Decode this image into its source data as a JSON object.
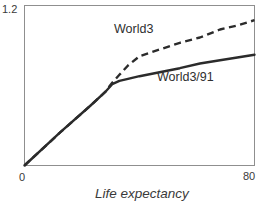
{
  "chart_data": {
    "type": "line",
    "title": "",
    "xlabel": "Life expectancy",
    "ylabel": "",
    "xlim": [
      0,
      80
    ],
    "ylim": [
      0,
      1.2
    ],
    "x_tick_labels": [
      "0",
      "80"
    ],
    "y_tick_labels": [
      "1.2"
    ],
    "grid": false,
    "legend": "inline-labels",
    "frame": "full-box",
    "series": [
      {
        "name": "World3",
        "line_style": "dashed",
        "color": "#2b2b2b",
        "points": [
          [
            0,
            0
          ],
          [
            12.5,
            0.25
          ],
          [
            23,
            0.45
          ],
          [
            28,
            0.55
          ],
          [
            30.5,
            0.62
          ],
          [
            33,
            0.68
          ],
          [
            36,
            0.75
          ],
          [
            40,
            0.82
          ],
          [
            47,
            0.87
          ],
          [
            54,
            0.92
          ],
          [
            61,
            0.96
          ],
          [
            68,
            1.02
          ],
          [
            74,
            1.05
          ],
          [
            80,
            1.09
          ]
        ]
      },
      {
        "name": "World3/91",
        "line_style": "solid",
        "color": "#2b2b2b",
        "points": [
          [
            0,
            0
          ],
          [
            12.5,
            0.25
          ],
          [
            23,
            0.45
          ],
          [
            28,
            0.55
          ],
          [
            30.5,
            0.61
          ],
          [
            33,
            0.635
          ],
          [
            36,
            0.65
          ],
          [
            40,
            0.67
          ],
          [
            47,
            0.7
          ],
          [
            54,
            0.73
          ],
          [
            61,
            0.765
          ],
          [
            68,
            0.79
          ],
          [
            74,
            0.81
          ],
          [
            80,
            0.83
          ]
        ]
      }
    ]
  },
  "colors": {
    "background": "#ffffff",
    "frame_border": "#8f8f8f",
    "line": "#2b2b2b",
    "text": "#3a3a3a"
  }
}
